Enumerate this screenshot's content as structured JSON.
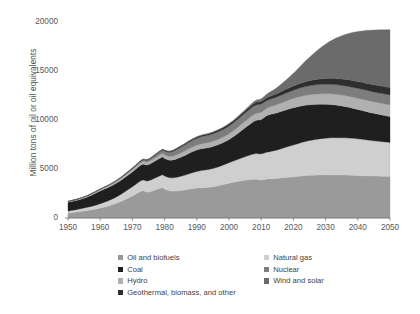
{
  "chart_data": {
    "type": "area",
    "stacked": true,
    "title": "",
    "subtitle": "",
    "xlabel": "",
    "ylabel": "Million tons of oil or oil equivalents",
    "xlim": [
      1950,
      2050
    ],
    "ylim": [
      0,
      20000
    ],
    "yticks": [
      0,
      5000,
      10000,
      15000,
      20000
    ],
    "ytick_labels": [
      "0",
      "5000",
      "10000",
      "15000",
      "20000"
    ],
    "xticks": [
      1950,
      1960,
      1970,
      1980,
      1990,
      2000,
      2010,
      2020,
      2030,
      2040,
      2050
    ],
    "xtick_labels": [
      "1950",
      "1960",
      "1970",
      "1980",
      "1990",
      "2000",
      "2010",
      "2020",
      "2030",
      "2040",
      "2050"
    ],
    "grid": false,
    "legend_position": "below",
    "x": [
      1950,
      1955,
      1960,
      1965,
      1970,
      1973,
      1975,
      1979,
      1980,
      1982,
      1985,
      1990,
      1995,
      2000,
      2005,
      2008,
      2010,
      2012,
      2015,
      2020,
      2025,
      2030,
      2035,
      2040,
      2045,
      2050
    ],
    "series": [
      {
        "name": "Oil and biofuels",
        "color": "#9a9a9a",
        "values": [
          520,
          720,
          1020,
          1500,
          2250,
          2750,
          2650,
          3050,
          2950,
          2750,
          2800,
          3050,
          3200,
          3550,
          3850,
          3950,
          3900,
          3980,
          4050,
          4200,
          4350,
          4400,
          4380,
          4330,
          4280,
          4250
        ]
      },
      {
        "name": "Natural gas",
        "color": "#cfcfcf",
        "values": [
          180,
          300,
          440,
          650,
          950,
          1100,
          1150,
          1320,
          1330,
          1350,
          1450,
          1700,
          1850,
          2100,
          2400,
          2600,
          2650,
          2750,
          2900,
          3250,
          3550,
          3750,
          3800,
          3750,
          3600,
          3450
        ]
      },
      {
        "name": "Coal",
        "color": "#1f1f1f",
        "values": [
          900,
          1000,
          1300,
          1400,
          1500,
          1600,
          1650,
          1800,
          1800,
          1800,
          1950,
          2200,
          2250,
          2350,
          2950,
          3350,
          3500,
          3750,
          3800,
          3800,
          3650,
          3450,
          3250,
          3000,
          2800,
          2650
        ]
      },
      {
        "name": "Hydro",
        "color": "#b0b0b0",
        "values": [
          80,
          110,
          150,
          200,
          260,
          290,
          310,
          360,
          370,
          390,
          430,
          490,
          540,
          600,
          670,
          710,
          740,
          780,
          840,
          940,
          1020,
          1080,
          1120,
          1150,
          1170,
          1190
        ]
      },
      {
        "name": "Nuclear",
        "color": "#7d7d7d",
        "values": [
          0,
          5,
          15,
          40,
          90,
          140,
          180,
          330,
          370,
          450,
          600,
          700,
          760,
          800,
          850,
          880,
          850,
          760,
          780,
          850,
          920,
          960,
          980,
          1000,
          1010,
          1020
        ]
      },
      {
        "name": "Geothermal, biomass, and other",
        "color": "#2e2e2e",
        "values": [
          20,
          25,
          30,
          40,
          55,
          65,
          70,
          85,
          90,
          95,
          110,
          130,
          150,
          180,
          220,
          250,
          270,
          300,
          340,
          430,
          520,
          600,
          660,
          700,
          730,
          760
        ]
      },
      {
        "name": "Wind and solar",
        "color": "#6b6b6b",
        "values": [
          0,
          0,
          0,
          0,
          0,
          0,
          0,
          2,
          3,
          5,
          10,
          20,
          35,
          60,
          110,
          190,
          260,
          380,
          620,
          1300,
          2400,
          3500,
          4400,
          5100,
          5600,
          5900
        ]
      }
    ]
  },
  "legend": {
    "left_column": [
      {
        "label": "Oil and biofuels",
        "color": "#9a9a9a"
      },
      {
        "label": "Coal",
        "color": "#1f1f1f"
      },
      {
        "label": "Hydro",
        "color": "#b0b0b0"
      }
    ],
    "right_column": [
      {
        "label": "Natural gas",
        "color": "#cfcfcf"
      },
      {
        "label": "Nuclear",
        "color": "#7d7d7d"
      },
      {
        "label": "Wind and solar",
        "color": "#6b6b6b"
      }
    ],
    "wide_item": {
      "label": "Geothermal, biomass, and other",
      "color": "#2e2e2e"
    }
  }
}
